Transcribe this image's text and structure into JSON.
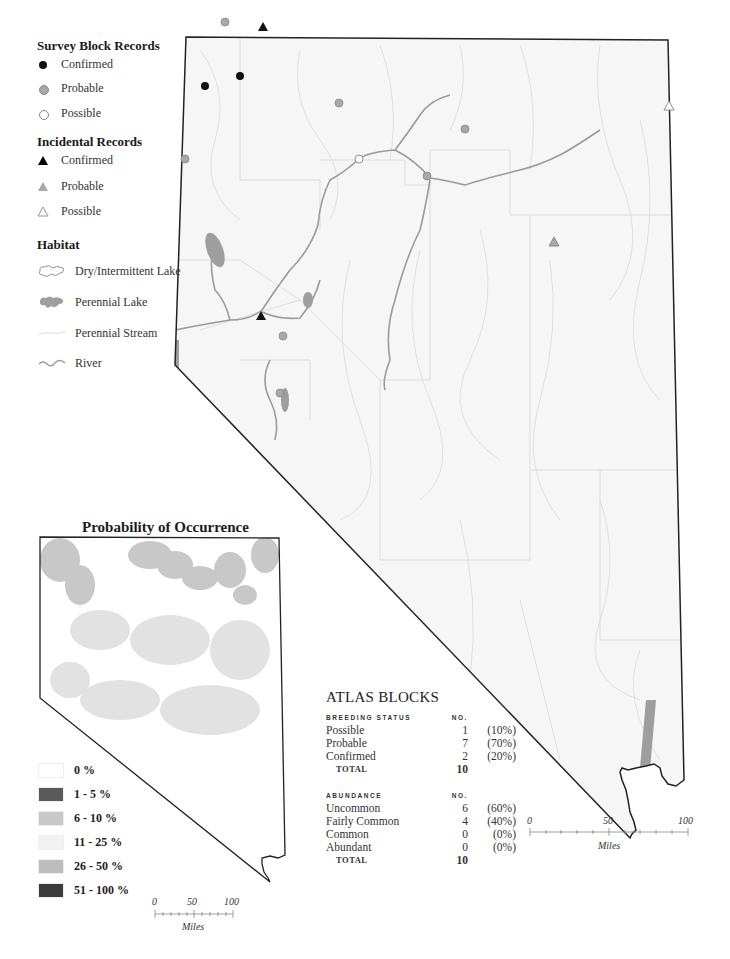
{
  "legend": {
    "survey": {
      "heading": "Survey Block Records",
      "items": [
        {
          "label": "Confirmed",
          "symbol": "filled-circle",
          "color": "#111111"
        },
        {
          "label": "Probable",
          "symbol": "gray-circle",
          "color": "#a8a8a8"
        },
        {
          "label": "Possible",
          "symbol": "hollow-circle",
          "color": "#ffffff"
        }
      ]
    },
    "incidental": {
      "heading": "Incidental Records",
      "items": [
        {
          "label": "Confirmed",
          "symbol": "filled-triangle",
          "color": "#111111"
        },
        {
          "label": "Probable",
          "symbol": "gray-triangle",
          "color": "#a8a8a8"
        },
        {
          "label": "Possible",
          "symbol": "hollow-triangle",
          "color": "#ffffff"
        }
      ]
    },
    "habitat": {
      "heading": "Habitat",
      "items": [
        {
          "label": "Dry/Intermittent Lake",
          "symbol": "dry-lake-outline"
        },
        {
          "label": "Perennial Lake",
          "symbol": "perennial-lake-fill",
          "color": "#9e9e9e"
        },
        {
          "label": "Perennial Stream",
          "symbol": "stream-line",
          "color": "#dddddd"
        },
        {
          "label": "River",
          "symbol": "river-line",
          "color": "#9a9a9a"
        }
      ]
    }
  },
  "main_map": {
    "records": {
      "survey_confirmed": [
        [
          205,
          86
        ],
        [
          240,
          76
        ]
      ],
      "survey_probable": [
        [
          225,
          22
        ],
        [
          339,
          103
        ],
        [
          465,
          129
        ],
        [
          185,
          159
        ],
        [
          427,
          176
        ],
        [
          283,
          336
        ],
        [
          280,
          393
        ]
      ],
      "survey_possible": [
        [
          359,
          159
        ]
      ],
      "incidental_confirmed": [
        [
          263,
          27
        ],
        [
          261,
          316
        ]
      ],
      "incidental_probable": [
        [
          554,
          242
        ]
      ],
      "incidental_possible": [
        [
          669,
          106
        ]
      ]
    },
    "scale_bar": {
      "ticks": [
        "0",
        "50",
        "100"
      ],
      "unit": "Miles"
    }
  },
  "probability_map": {
    "title": "Probability of Occurrence",
    "classes": [
      {
        "label": "0 %",
        "color": "#ffffff"
      },
      {
        "label": "1 - 5 %",
        "color": "#5a5a5a"
      },
      {
        "label": "6 - 10 %",
        "color": "#c8c8c8"
      },
      {
        "label": "11 - 25 %",
        "color": "#f2f2f2"
      },
      {
        "label": "26 - 50 %",
        "color": "#bdbdbd"
      },
      {
        "label": "51 - 100 %",
        "color": "#3c3c3c"
      }
    ],
    "scale_bar": {
      "ticks": [
        "0",
        "50",
        "100"
      ],
      "unit": "Miles"
    }
  },
  "atlas_blocks": {
    "title": "ATLAS BLOCKS",
    "breeding": {
      "header": "BREEDING STATUS",
      "no_header": "NO.",
      "rows": [
        {
          "label": "Possible",
          "no": "1",
          "pct": "(10%)"
        },
        {
          "label": "Probable",
          "no": "7",
          "pct": "(70%)"
        },
        {
          "label": "Confirmed",
          "no": "2",
          "pct": "(20%)"
        }
      ],
      "total_label": "TOTAL",
      "total": "10"
    },
    "abundance": {
      "header": "ABUNDANCE",
      "no_header": "NO.",
      "rows": [
        {
          "label": "Uncommon",
          "no": "6",
          "pct": "(60%)"
        },
        {
          "label": "Fairly Common",
          "no": "4",
          "pct": "(40%)"
        },
        {
          "label": "Common",
          "no": "0",
          "pct": "(0%)"
        },
        {
          "label": "Abundant",
          "no": "0",
          "pct": "(0%)"
        }
      ],
      "total_label": "TOTAL",
      "total": "10"
    }
  }
}
